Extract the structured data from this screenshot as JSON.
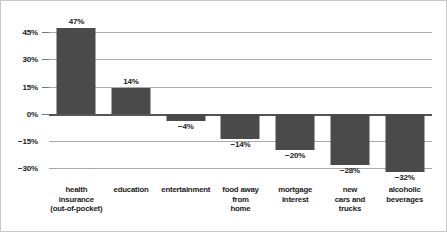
{
  "chart_data": {
    "type": "bar",
    "title": "",
    "subtitle": "",
    "xlabel": "",
    "ylabel": "",
    "ylim": [
      -37,
      50
    ],
    "grid": true,
    "legend": null,
    "zero_line": true,
    "bar_color": "#4a4a4a",
    "gridline_color": "#a9a9a9",
    "zero_line_color": "#555555",
    "yticks": [
      45,
      30,
      15,
      0,
      -15,
      -30
    ],
    "ytick_labels": [
      "45%",
      "30%",
      "15%",
      "0%",
      "−15%",
      "−30%"
    ],
    "categories": [
      "health insurance (out-of-pocket)",
      "education",
      "entertainment",
      "food away from home",
      "mortgage interest",
      "new cars and trucks",
      "alcoholic beverages"
    ],
    "category_lines": [
      [
        "health",
        "insurance",
        "(out-of-pocket)"
      ],
      [
        "education"
      ],
      [
        "entertainment"
      ],
      [
        "food away",
        "from",
        "home"
      ],
      [
        "mortgage",
        "interest"
      ],
      [
        "new",
        "cars and",
        "trucks"
      ],
      [
        "alcoholic",
        "beverages"
      ]
    ],
    "values": [
      47,
      14,
      -4,
      -14,
      -20,
      -28,
      -32
    ],
    "value_labels": [
      "47%",
      "14%",
      "−4%",
      "−14%",
      "−20%",
      "−28%",
      "−32%"
    ]
  }
}
